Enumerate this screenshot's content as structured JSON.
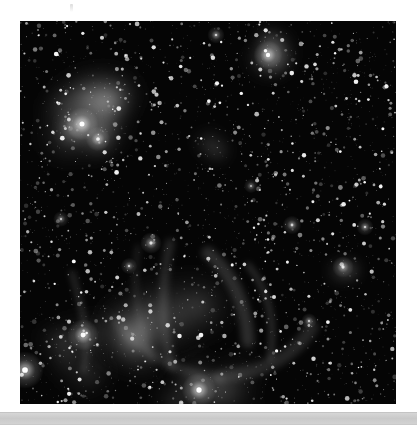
{
  "app": {
    "title": "Astronomical Image Viewer",
    "background_color": "#ffffff"
  },
  "plate": {
    "name": "deep-sky-starfield",
    "alt_text": "Monochrome deep-sky astronomical exposure of a dense star field with emission nebulosity",
    "x": 20,
    "y": 21,
    "width": 376,
    "height": 383,
    "background_color": "#050505",
    "star_color": "#ffffff",
    "nebula_color": "#9a9a9a",
    "color_mode": "grayscale"
  },
  "top_mark": {
    "label": "",
    "color": "#bebebe"
  },
  "bottom_bar": {
    "label": "",
    "track_color": "#cfcfcf",
    "thumb_color": "#d2d2d2",
    "y": 412,
    "height": 11
  },
  "chart_data": {
    "type": "scatter",
    "title": "",
    "xlabel": "",
    "ylabel": "",
    "xlim": [
      0,
      376
    ],
    "ylim": [
      0,
      383
    ],
    "grid": false,
    "legend": null,
    "background": "#050505",
    "nebulae": [
      {
        "name": "upper-left-bright-nebula",
        "cx": 66,
        "cy": 105,
        "rx": 52,
        "ry": 60,
        "peak": 0.62
      },
      {
        "name": "upper-left-core-knot",
        "cx": 58,
        "cy": 100,
        "rx": 20,
        "ry": 18,
        "peak": 0.85
      },
      {
        "name": "top-right-diffuse-nebula",
        "cx": 248,
        "cy": 34,
        "rx": 34,
        "ry": 26,
        "peak": 0.7
      },
      {
        "name": "mid-faint-patch",
        "cx": 192,
        "cy": 122,
        "rx": 26,
        "ry": 20,
        "peak": 0.26
      },
      {
        "name": "lower-shell-arc",
        "cx": 150,
        "cy": 290,
        "rx": 78,
        "ry": 70,
        "peak": 0.34
      },
      {
        "name": "lower-left-glow",
        "cx": 55,
        "cy": 330,
        "rx": 58,
        "ry": 48,
        "peak": 0.22
      },
      {
        "name": "bottom-center-glow",
        "cx": 175,
        "cy": 360,
        "rx": 80,
        "ry": 42,
        "peak": 0.3
      },
      {
        "name": "right-compact-cluster",
        "cx": 323,
        "cy": 246,
        "rx": 16,
        "ry": 12,
        "peak": 0.58
      }
    ],
    "bright_stars": [
      {
        "x": 62,
        "y": 103,
        "mag": 1.0,
        "r": 4.6
      },
      {
        "x": 78,
        "y": 118,
        "mag": 0.86,
        "r": 3.4
      },
      {
        "x": 248,
        "y": 34,
        "mag": 0.96,
        "r": 4.0
      },
      {
        "x": 5,
        "y": 349,
        "mag": 1.0,
        "r": 5.2
      },
      {
        "x": 63,
        "y": 314,
        "mag": 0.94,
        "r": 4.4
      },
      {
        "x": 179,
        "y": 369,
        "mag": 1.0,
        "r": 4.8
      },
      {
        "x": 323,
        "y": 246,
        "mag": 0.8,
        "r": 3.0
      },
      {
        "x": 131,
        "y": 222,
        "mag": 0.78,
        "r": 3.0
      },
      {
        "x": 272,
        "y": 204,
        "mag": 0.72,
        "r": 2.6
      },
      {
        "x": 196,
        "y": 14,
        "mag": 0.7,
        "r": 2.4
      },
      {
        "x": 345,
        "y": 206,
        "mag": 0.68,
        "r": 2.4
      },
      {
        "x": 109,
        "y": 245,
        "mag": 0.66,
        "r": 2.3
      },
      {
        "x": 289,
        "y": 300,
        "mag": 0.64,
        "r": 2.2
      },
      {
        "x": 41,
        "y": 198,
        "mag": 0.62,
        "r": 2.2
      },
      {
        "x": 231,
        "y": 165,
        "mag": 0.6,
        "r": 2.0
      }
    ],
    "star_count": 2600
  }
}
